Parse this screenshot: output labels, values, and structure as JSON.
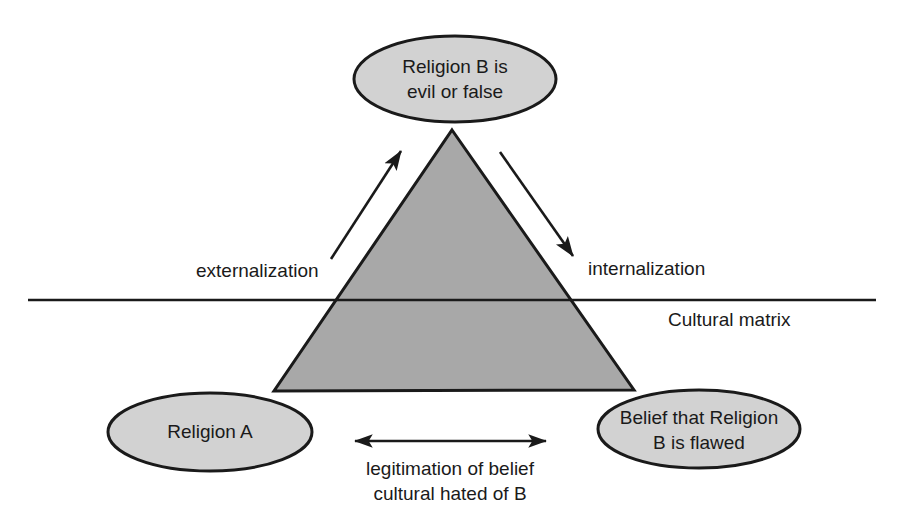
{
  "diagram": {
    "colors": {
      "background": "#ffffff",
      "ellipse_fill": "#d2d2d2",
      "triangle_fill": "#a8a8a8",
      "stroke": "#1a1a1a",
      "text": "#1a1a1a"
    },
    "nodes": [
      {
        "id": "religion-b-evil",
        "lines": [
          "Religion B is",
          "evil or false"
        ],
        "cx": 455,
        "cy": 79,
        "rx": 101,
        "ry": 43
      },
      {
        "id": "religion-a",
        "lines": [
          "Religion A"
        ],
        "cx": 210,
        "cy": 432,
        "rx": 102,
        "ry": 39
      },
      {
        "id": "belief-religion-b-flawed",
        "lines": [
          "Belief that Religion",
          "B is flawed"
        ],
        "cx": 699,
        "cy": 429,
        "rx": 101,
        "ry": 39
      }
    ],
    "triangle": {
      "apex": {
        "x": 452,
        "y": 130
      },
      "bottom_left": {
        "x": 274,
        "y": 391
      },
      "bottom_right": {
        "x": 634,
        "y": 390
      }
    },
    "matrix_line": {
      "label": "Cultural matrix",
      "label_x": 668,
      "label_y": 321,
      "x1": 28,
      "x2": 876,
      "y": 300
    },
    "arrows": [
      {
        "id": "externalization-arrow",
        "label": "externalization",
        "x1": 331,
        "y1": 259,
        "x2": 401,
        "y2": 151,
        "label_x": 196,
        "label_y": 272
      },
      {
        "id": "internalization-arrow",
        "label": "internalization",
        "x1": 500,
        "y1": 152,
        "x2": 573,
        "y2": 256,
        "label_x": 588,
        "label_y": 270
      },
      {
        "id": "legitimation-double-arrow",
        "label_lines": [
          "legitimation of belief",
          "cultural hated of B"
        ],
        "x1": 355,
        "y1": 441,
        "x2": 546,
        "y2": 441,
        "label_x": 450,
        "label_y": 470,
        "label_line_height": 25
      }
    ]
  }
}
